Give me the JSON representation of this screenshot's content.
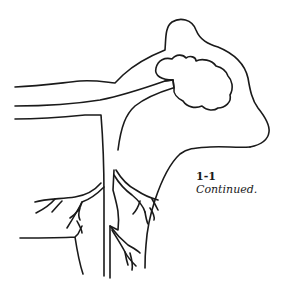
{
  "figure": {
    "type": "line-illustration",
    "stroke_color": "#1a1a1a",
    "background_color": "#ffffff"
  },
  "caption": {
    "number": "1-1",
    "text": "Continued."
  }
}
